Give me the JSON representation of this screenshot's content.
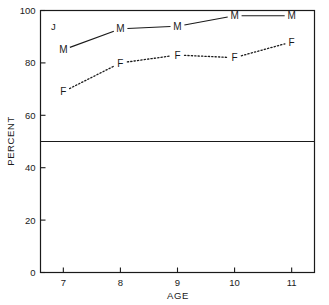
{
  "chart_data": {
    "type": "line",
    "title": "",
    "panel_label": "J",
    "xlabel": "AGE",
    "ylabel": "PERCENT",
    "x": [
      7,
      8,
      9,
      10,
      11
    ],
    "xtick_labels": [
      "7",
      "8",
      "9",
      "10",
      "11"
    ],
    "ytick_labels": [
      "0",
      "20",
      "40",
      "60",
      "80",
      "100"
    ],
    "yticks": [
      0,
      20,
      40,
      60,
      80,
      100
    ],
    "xlim": [
      6.6,
      11.4
    ],
    "ylim": [
      0,
      100
    ],
    "grid": false,
    "legend": "inline-point-labels",
    "reference_line": {
      "axis": "y",
      "value": 50,
      "style": "solid"
    },
    "series": [
      {
        "name": "M",
        "label": "M",
        "marker_label": "M",
        "line_style": "solid",
        "color": "#1a1a1a",
        "values": [
          85,
          93,
          94,
          98,
          98
        ]
      },
      {
        "name": "F",
        "label": "F",
        "marker_label": "F",
        "line_style": "dotted",
        "color": "#1a1a1a",
        "values": [
          69,
          80,
          83,
          82,
          88
        ]
      }
    ]
  },
  "figure": {
    "background_color": "#ffffff",
    "axis_color": "#1a1a1a"
  }
}
